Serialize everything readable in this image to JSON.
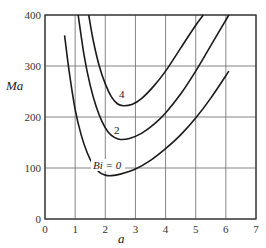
{
  "chart_data": {
    "type": "line",
    "title": "",
    "xlabel": "a",
    "ylabel": "Ma",
    "xlim": [
      0,
      7
    ],
    "ylim": [
      0,
      400
    ],
    "x_ticks": [
      "0",
      "1",
      "2",
      "3",
      "4",
      "5",
      "6",
      "7"
    ],
    "y_ticks": [
      "0",
      "100",
      "200",
      "300",
      "400"
    ],
    "grid": true,
    "legend": "inline curve labels",
    "series": [
      {
        "name": "Bi = 0",
        "label": "Bi = 0",
        "points": [
          [
            0.65,
            360
          ],
          [
            0.8,
            290
          ],
          [
            1.0,
            215
          ],
          [
            1.2,
            165
          ],
          [
            1.4,
            130
          ],
          [
            1.6,
            106
          ],
          [
            1.8,
            92
          ],
          [
            2.0,
            86
          ],
          [
            2.2,
            85
          ],
          [
            2.5,
            88
          ],
          [
            3.0,
            98
          ],
          [
            3.5,
            115
          ],
          [
            4.0,
            138
          ],
          [
            4.5,
            165
          ],
          [
            5.0,
            198
          ],
          [
            5.5,
            237
          ],
          [
            6.1,
            290
          ]
        ]
      },
      {
        "name": "Bi = 2",
        "label": "2",
        "points": [
          [
            1.1,
            400
          ],
          [
            1.3,
            320
          ],
          [
            1.5,
            262
          ],
          [
            1.7,
            220
          ],
          [
            1.9,
            190
          ],
          [
            2.1,
            170
          ],
          [
            2.3,
            160
          ],
          [
            2.5,
            156
          ],
          [
            2.8,
            158
          ],
          [
            3.2,
            168
          ],
          [
            3.6,
            185
          ],
          [
            4.0,
            208
          ],
          [
            4.5,
            245
          ],
          [
            5.0,
            290
          ],
          [
            5.5,
            340
          ],
          [
            6.1,
            400
          ]
        ]
      },
      {
        "name": "Bi = 4",
        "label": "4",
        "points": [
          [
            1.45,
            400
          ],
          [
            1.6,
            350
          ],
          [
            1.8,
            300
          ],
          [
            2.0,
            265
          ],
          [
            2.2,
            240
          ],
          [
            2.4,
            226
          ],
          [
            2.6,
            222
          ],
          [
            2.9,
            225
          ],
          [
            3.2,
            236
          ],
          [
            3.6,
            260
          ],
          [
            4.0,
            290
          ],
          [
            4.5,
            335
          ],
          [
            5.0,
            380
          ],
          [
            5.25,
            400
          ]
        ]
      }
    ]
  }
}
